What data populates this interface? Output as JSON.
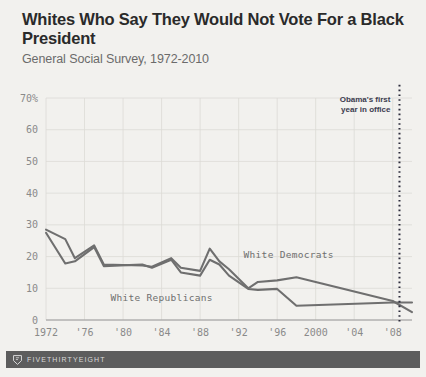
{
  "header": {
    "title": "Whites Who Say They Would Not Vote For a Black President",
    "subtitle": "General Social Survey, 1972-2010"
  },
  "footer": {
    "brand": "FIVETHIRTYEIGHT",
    "logo_icon": "fivethirtyeight-logo-icon"
  },
  "colors": {
    "background": "#f2f1ee",
    "line": "#6f6f6f",
    "grid": "#dcdbd6",
    "axis_text": "#8a8a8a",
    "title_text": "#2a2a2a",
    "subtitle_text": "#6b6b6b",
    "annotation_text": "#3b3b4e",
    "footer_bar": "#5d5d5d",
    "footer_text": "#d9d9d9"
  },
  "chart_data": {
    "type": "line",
    "title": "Whites Who Say They Would Not Vote For a Black President",
    "subtitle": "General Social Survey, 1972-2010",
    "xlabel": "",
    "ylabel": "",
    "xlim": [
      1972,
      2010
    ],
    "ylim": [
      0,
      70
    ],
    "yticks": [
      0,
      10,
      20,
      30,
      40,
      50,
      60,
      70
    ],
    "ytick_labels": [
      "0",
      "10",
      "20",
      "30",
      "40",
      "50",
      "60",
      "70%"
    ],
    "xticks": [
      1972,
      1976,
      1980,
      1984,
      1988,
      1992,
      1996,
      2000,
      2004,
      2008
    ],
    "xtick_labels": [
      "1972",
      "'76",
      "'80",
      "'84",
      "'88",
      "'92",
      "'96",
      "2000",
      "'04",
      "'08"
    ],
    "grid": true,
    "legend": "inline-labels",
    "series": [
      {
        "name": "White Democrats",
        "label_x": 1997.2,
        "label_y": 19.5,
        "x": [
          1972,
          1974,
          1975,
          1977,
          1978,
          1982,
          1983,
          1985,
          1986,
          1988,
          1989,
          1990,
          1991,
          1993,
          1994,
          1996,
          1998,
          2008,
          2010
        ],
        "y": [
          28.5,
          25.5,
          19.5,
          23.5,
          17.5,
          17.2,
          16.8,
          19.5,
          16.5,
          15.5,
          22.5,
          18.5,
          16.0,
          10.0,
          12.0,
          12.5,
          13.5,
          6.0,
          2.5
        ]
      },
      {
        "name": "White Republicans",
        "label_x": 1984.0,
        "label_y": 6.0,
        "x": [
          1972,
          1974,
          1975,
          1977,
          1978,
          1982,
          1983,
          1985,
          1986,
          1988,
          1989,
          1990,
          1991,
          1993,
          1994,
          1996,
          1998,
          2008,
          2010
        ],
        "y": [
          27.5,
          17.8,
          18.5,
          23.0,
          17.0,
          17.5,
          16.5,
          19.0,
          15.0,
          14.0,
          19.0,
          17.5,
          14.0,
          9.8,
          9.5,
          9.8,
          4.5,
          5.5,
          5.5
        ]
      }
    ],
    "annotations": [
      {
        "name": "obama-first-year-marker",
        "text_line_1": "Obama's first",
        "text_line_2": "year in office",
        "x": 2008.7,
        "style": "dotted-vertical-line"
      }
    ]
  }
}
